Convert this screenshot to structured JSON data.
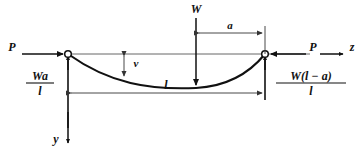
{
  "figure": {
    "type": "engineering-free-body-diagram",
    "background_color": "#ffffff",
    "line_color": "#111111"
  },
  "labels": {
    "axial_load_left": "P",
    "axial_load_right": "P",
    "axis_horizontal": "z",
    "axis_vertical": "y",
    "transverse_load": "W",
    "deflection": "v",
    "span": "l",
    "distance_a": "a",
    "reaction_left_numerator": "Wa",
    "reaction_left_denominator": "l",
    "reaction_right_numerator": "W(l − a)",
    "reaction_right_denominator": "l"
  },
  "geometry": {
    "left_support_x": 68,
    "right_support_x": 265,
    "support_y": 54,
    "load_x": 196,
    "load_top_y": 18,
    "curve_mid_deflection": 20,
    "span_dim_y": 93,
    "a_dim_y": 33
  },
  "annotations": [
    {
      "name": "axial-load-left",
      "text": "P",
      "role": "applied axial compressive force at left pin"
    },
    {
      "name": "axial-load-right",
      "text": "P",
      "role": "applied axial compressive force at right pin"
    },
    {
      "name": "transverse-load",
      "text": "W",
      "role": "downward concentrated transverse load"
    },
    {
      "name": "deflection",
      "text": "v",
      "role": "lateral deflection of the beam axis"
    },
    {
      "name": "span-dimension",
      "text": "l",
      "role": "total span between supports"
    },
    {
      "name": "distance-a",
      "text": "a",
      "role": "distance from load to right support"
    },
    {
      "name": "reaction-left",
      "text": "Wa/l",
      "role": "vertical reaction at left support"
    },
    {
      "name": "reaction-right",
      "text": "W(l-a)/l",
      "role": "vertical reaction at right support"
    },
    {
      "name": "axis-z",
      "text": "z",
      "role": "horizontal coordinate axis, positive right"
    },
    {
      "name": "axis-y",
      "text": "y",
      "role": "vertical coordinate axis, positive downward"
    }
  ]
}
